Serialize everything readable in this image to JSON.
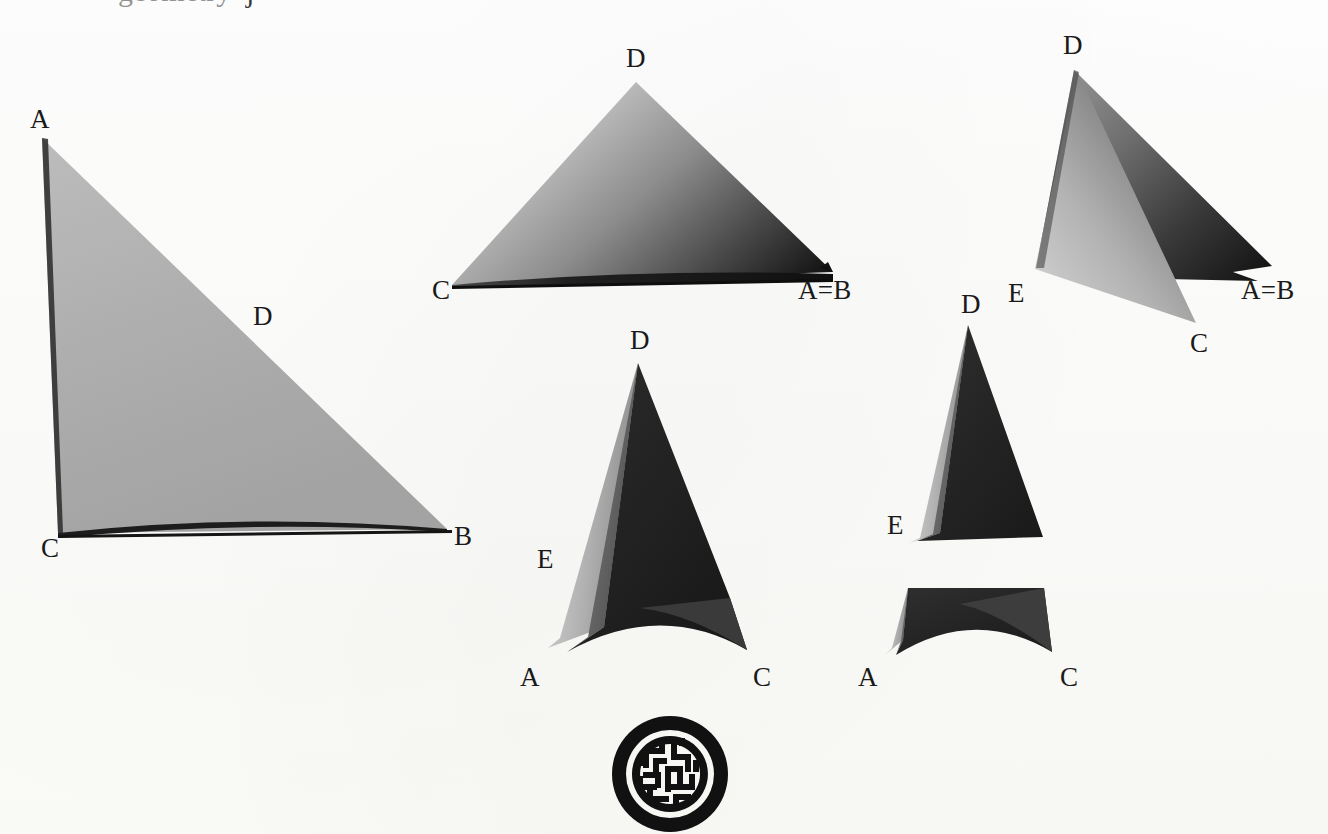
{
  "page": {
    "background_color": "#fdfdfb",
    "ink_color": "#1a1a1a",
    "width": 1328,
    "height": 834,
    "top_text_remnant": {
      "fragment_1": "geometry",
      "fragment_2": "j"
    }
  },
  "figures": [
    {
      "id": "figure-1",
      "name": "large-left-triangle",
      "caption_letters": [
        "A",
        "C",
        "B",
        "D"
      ],
      "labels": [
        {
          "text": "A",
          "x": 30,
          "y": 106
        },
        {
          "text": "D",
          "x": 253,
          "y": 303
        },
        {
          "text": "C",
          "x": 41,
          "y": 535
        },
        {
          "text": "B",
          "x": 454,
          "y": 523
        }
      ],
      "fill_light": "#b5b5b5",
      "fill_dark": "#8e8e8e"
    },
    {
      "id": "figure-2",
      "name": "top-middle-triangle",
      "caption_letters": [
        "D",
        "C",
        "A=B"
      ],
      "labels": [
        {
          "text": "D",
          "x": 626,
          "y": 45
        },
        {
          "text": "C",
          "x": 432,
          "y": 277
        },
        {
          "text": "A=B",
          "x": 798,
          "y": 277
        }
      ],
      "fill_light": "#cfcfcf",
      "fill_dark": "#1c1c1c"
    },
    {
      "id": "figure-3",
      "name": "top-right-triangle",
      "caption_letters": [
        "D",
        "E",
        "C",
        "A=B"
      ],
      "labels": [
        {
          "text": "D",
          "x": 1063,
          "y": 32
        },
        {
          "text": "E",
          "x": 1008,
          "y": 280
        },
        {
          "text": "C",
          "x": 1190,
          "y": 330
        },
        {
          "text": "A=B",
          "x": 1241,
          "y": 277
        }
      ],
      "fill_light": "#c9c9c9",
      "fill_dark": "#262626"
    },
    {
      "id": "figure-4",
      "name": "bottom-middle-triangle",
      "caption_letters": [
        "D",
        "E",
        "A",
        "C"
      ],
      "labels": [
        {
          "text": "D",
          "x": 630,
          "y": 327
        },
        {
          "text": "E",
          "x": 537,
          "y": 546
        },
        {
          "text": "A",
          "x": 520,
          "y": 664
        },
        {
          "text": "C",
          "x": 753,
          "y": 664
        }
      ],
      "fill_light": "#b8b8b8",
      "fill_dark": "#232323"
    },
    {
      "id": "figure-5",
      "name": "bottom-right-split-triangle",
      "caption_letters": [
        "D",
        "E",
        "A",
        "C"
      ],
      "labels": [
        {
          "text": "D",
          "x": 961,
          "y": 291
        },
        {
          "text": "E",
          "x": 887,
          "y": 512
        },
        {
          "text": "A",
          "x": 858,
          "y": 664
        },
        {
          "text": "C",
          "x": 1060,
          "y": 664
        }
      ],
      "fill_light": "#bdbdbd",
      "fill_dark": "#272727"
    }
  ],
  "logo": {
    "name": "circular-maze-seal",
    "color": "#111111",
    "shape": "ring with labyrinth interior"
  }
}
